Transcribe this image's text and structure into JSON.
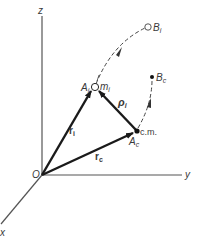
{
  "figure": {
    "type": "vector-diagram",
    "axes": {
      "z_label": "z",
      "y_label": "y",
      "x_label": "x",
      "origin_label": "O"
    },
    "points": {
      "particle_label": "A",
      "particle_sub": "i",
      "mass_label": "m",
      "mass_sub": "i",
      "cm_label": "c.m.",
      "cm_point_label": "A",
      "cm_point_sub": "c",
      "Bi_label": "B",
      "Bi_sub": "i",
      "Bc_label": "B",
      "Bc_sub": "c"
    },
    "vectors": {
      "ri_label": "r",
      "ri_sub": "i",
      "rc_label": "r",
      "rc_sub": "c",
      "rho_label": "ρ",
      "rho_sub": "i"
    },
    "colors": {
      "line": "#2a2a2a",
      "axis": "#555555",
      "text": "#3a3a3a"
    }
  }
}
